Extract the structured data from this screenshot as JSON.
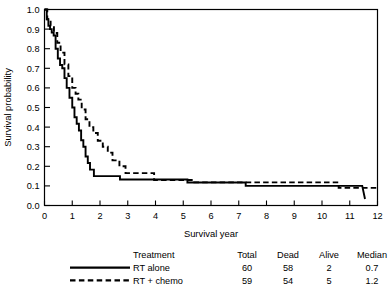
{
  "chart_data": {
    "type": "line",
    "title": "",
    "xlabel": "Survival year",
    "ylabel": "Survival probability",
    "xlim": [
      0,
      12
    ],
    "ylim": [
      0.0,
      1.0
    ],
    "xticks": [
      "0",
      "1",
      "2",
      "3",
      "4",
      "5",
      "6",
      "7",
      "8",
      "9",
      "10",
      "11",
      "12"
    ],
    "yticks": [
      "0.0",
      "0.1",
      "0.2",
      "0.3",
      "0.4",
      "0.5",
      "0.6",
      "0.7",
      "0.8",
      "0.9",
      "1.0"
    ],
    "grid": false,
    "legend_position": "below-plot",
    "series": [
      {
        "name": "RT alone",
        "style": "solid",
        "color": "#000000",
        "x": [
          0.0,
          0.08,
          0.08,
          0.14,
          0.14,
          0.2,
          0.2,
          0.26,
          0.26,
          0.33,
          0.33,
          0.4,
          0.4,
          0.48,
          0.48,
          0.56,
          0.56,
          0.64,
          0.64,
          0.72,
          0.72,
          0.8,
          0.8,
          0.9,
          0.9,
          1.0,
          1.0,
          1.08,
          1.08,
          1.16,
          1.16,
          1.24,
          1.24,
          1.32,
          1.32,
          1.4,
          1.4,
          1.48,
          1.48,
          1.56,
          1.56,
          1.64,
          1.64,
          1.78,
          1.78,
          2.72,
          2.72,
          5.15,
          5.15,
          5.45,
          5.45,
          7.25,
          7.25,
          11.45,
          11.45,
          11.55
        ],
        "y": [
          1.0,
          1.0,
          0.95,
          0.95,
          0.917,
          0.917,
          0.9,
          0.9,
          0.883,
          0.883,
          0.867,
          0.867,
          0.8,
          0.8,
          0.75,
          0.75,
          0.717,
          0.717,
          0.7,
          0.7,
          0.65,
          0.65,
          0.6,
          0.6,
          0.55,
          0.55,
          0.5,
          0.5,
          0.45,
          0.45,
          0.417,
          0.417,
          0.383,
          0.383,
          0.333,
          0.333,
          0.3,
          0.3,
          0.25,
          0.25,
          0.217,
          0.217,
          0.183,
          0.183,
          0.15,
          0.15,
          0.133,
          0.133,
          0.117,
          0.117,
          0.117,
          0.117,
          0.1,
          0.1,
          0.1,
          0.033
        ]
      },
      {
        "name": "RT + chemo",
        "style": "dashed",
        "color": "#000000",
        "x": [
          0.0,
          0.1,
          0.1,
          0.22,
          0.22,
          0.34,
          0.34,
          0.46,
          0.46,
          0.58,
          0.58,
          0.72,
          0.72,
          0.86,
          0.86,
          1.0,
          1.0,
          1.12,
          1.12,
          1.22,
          1.22,
          1.34,
          1.34,
          1.48,
          1.48,
          1.62,
          1.62,
          1.76,
          1.76,
          1.92,
          1.92,
          2.1,
          2.1,
          2.28,
          2.28,
          2.45,
          2.45,
          2.7,
          2.7,
          2.92,
          2.92,
          3.55,
          3.55,
          3.95,
          3.95,
          5.0,
          5.0,
          5.4,
          5.4,
          10.6,
          10.6,
          12.0
        ],
        "y": [
          1.0,
          1.0,
          0.95,
          0.95,
          0.917,
          0.917,
          0.88,
          0.88,
          0.83,
          0.83,
          0.78,
          0.78,
          0.72,
          0.72,
          0.66,
          0.66,
          0.6,
          0.6,
          0.57,
          0.57,
          0.54,
          0.54,
          0.49,
          0.49,
          0.44,
          0.44,
          0.4,
          0.4,
          0.37,
          0.37,
          0.33,
          0.33,
          0.3,
          0.3,
          0.27,
          0.27,
          0.23,
          0.23,
          0.2,
          0.2,
          0.165,
          0.165,
          0.165,
          0.165,
          0.13,
          0.13,
          0.13,
          0.13,
          0.118,
          0.118,
          0.09,
          0.09
        ]
      }
    ]
  },
  "legend": {
    "headers": [
      "Treatment",
      "Total",
      "Dead",
      "Alive",
      "Median"
    ],
    "rows": [
      {
        "sample": "solid",
        "treatment": "RT alone",
        "total": "60",
        "dead": "58",
        "alive": "2",
        "median": "0.7"
      },
      {
        "sample": "dashed",
        "treatment": "RT + chemo",
        "total": "59",
        "dead": "54",
        "alive": "5",
        "median": "1.2"
      }
    ]
  }
}
